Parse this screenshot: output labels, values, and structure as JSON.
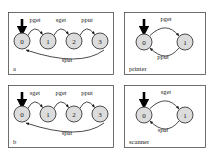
{
  "figure": {
    "type": "state-machine-diagram",
    "width": 214,
    "height": 159,
    "background_color": "#ffffff",
    "state_fill_color": "#dcdcdc",
    "state_stroke_color": "#3a3a3a",
    "panel_stroke_color": "#4a4a4a",
    "edge_color": "#2a2a2a"
  },
  "panels": [
    {
      "id": "panel-a",
      "caption": "a",
      "caption_position": "bottom-left",
      "states": [
        "0",
        "1",
        "2",
        "3"
      ],
      "initial_state": "0",
      "forward_transitions": [
        {
          "from": "0",
          "to": "1",
          "label": "pget"
        },
        {
          "from": "1",
          "to": "2",
          "label": "sget"
        },
        {
          "from": "2",
          "to": "3",
          "label": "pput"
        }
      ],
      "return_transitions": [
        {
          "from": "3",
          "to": "0",
          "label": "sput"
        }
      ]
    },
    {
      "id": "panel-printer",
      "caption": "printer",
      "caption_position": "bottom-left",
      "states": [
        "0",
        "1"
      ],
      "initial_state": "0",
      "forward_transitions": [
        {
          "from": "0",
          "to": "1",
          "label": "pget"
        }
      ],
      "return_transitions": [
        {
          "from": "1",
          "to": "0",
          "label": "pput"
        }
      ]
    },
    {
      "id": "panel-b",
      "caption": "b",
      "caption_position": "bottom-left",
      "states": [
        "0",
        "1",
        "2",
        "3"
      ],
      "initial_state": "0",
      "forward_transitions": [
        {
          "from": "0",
          "to": "1",
          "label": "sget"
        },
        {
          "from": "1",
          "to": "2",
          "label": "pget"
        },
        {
          "from": "2",
          "to": "3",
          "label": "pput"
        }
      ],
      "return_transitions": [
        {
          "from": "3",
          "to": "0",
          "label": "sput"
        }
      ]
    },
    {
      "id": "panel-scanner",
      "caption": "scanner",
      "caption_position": "bottom-left",
      "states": [
        "0",
        "1"
      ],
      "initial_state": "0",
      "forward_transitions": [
        {
          "from": "0",
          "to": "1",
          "label": "sget"
        }
      ],
      "return_transitions": [
        {
          "from": "1",
          "to": "0",
          "label": "sput"
        }
      ]
    }
  ]
}
